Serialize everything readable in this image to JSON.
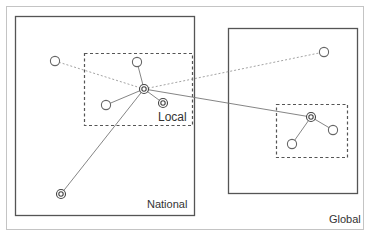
{
  "diagram": {
    "type": "network-scale-diagram",
    "colors": {
      "frame": "#b8b8b8",
      "box": "#555555",
      "dashed_box": "#555555",
      "solid_link": "#777777",
      "dashed_link": "#999999",
      "node_stroke": "#666666",
      "hub_stroke": "#444444",
      "text": "#333333"
    },
    "labels": {
      "local": "Local",
      "national": "National",
      "global": "Global"
    },
    "regions": [
      {
        "id": "national",
        "label": "National",
        "style": "solid",
        "x": 15,
        "y": 16,
        "w": 179,
        "h": 199
      },
      {
        "id": "global",
        "label": "Global",
        "style": "solid",
        "x": 228,
        "y": 28,
        "w": 129,
        "h": 165
      },
      {
        "id": "local-left",
        "label": "Local",
        "style": "dashed",
        "x": 84,
        "y": 53,
        "w": 108,
        "h": 72
      },
      {
        "id": "local-right",
        "label": "",
        "style": "dashed",
        "x": 276,
        "y": 104,
        "w": 71,
        "h": 53
      }
    ],
    "nodes": [
      {
        "id": "A",
        "x": 55,
        "y": 61,
        "kind": "hollow"
      },
      {
        "id": "B",
        "x": 137,
        "y": 62,
        "kind": "hollow"
      },
      {
        "id": "hub",
        "x": 144,
        "y": 89,
        "kind": "double"
      },
      {
        "id": "C",
        "x": 106,
        "y": 105,
        "kind": "hollow"
      },
      {
        "id": "D",
        "x": 163,
        "y": 103,
        "kind": "double"
      },
      {
        "id": "E",
        "x": 61,
        "y": 194,
        "kind": "double"
      },
      {
        "id": "G1",
        "x": 324,
        "y": 52,
        "kind": "hollow"
      },
      {
        "id": "hub2",
        "x": 311,
        "y": 117,
        "kind": "double"
      },
      {
        "id": "G2",
        "x": 333,
        "y": 130,
        "kind": "hollow"
      },
      {
        "id": "G3",
        "x": 292,
        "y": 144,
        "kind": "hollow"
      }
    ],
    "links": [
      {
        "from": "A",
        "to": "hub",
        "style": "dashed"
      },
      {
        "from": "hub",
        "to": "G1",
        "style": "dashed"
      },
      {
        "from": "B",
        "to": "hub",
        "style": "solid"
      },
      {
        "from": "C",
        "to": "hub",
        "style": "solid"
      },
      {
        "from": "D",
        "to": "hub",
        "style": "solid"
      },
      {
        "from": "E",
        "to": "hub",
        "style": "solid"
      },
      {
        "from": "hub",
        "to": "hub2",
        "style": "solid"
      },
      {
        "from": "hub2",
        "to": "G2",
        "style": "solid"
      },
      {
        "from": "hub2",
        "to": "G3",
        "style": "solid"
      }
    ]
  }
}
